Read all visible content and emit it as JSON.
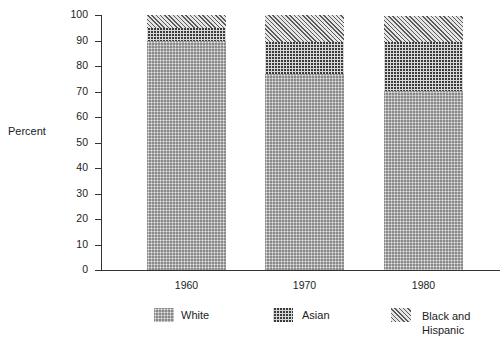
{
  "chart_data": {
    "type": "bar",
    "stacked": true,
    "title": "",
    "xlabel": "",
    "ylabel": "Percent",
    "ylim": [
      0,
      100
    ],
    "yticks": [
      "0",
      "10",
      "20",
      "30",
      "40",
      "50",
      "60",
      "70",
      "80",
      "90",
      "100"
    ],
    "categories": [
      "1960",
      "1970",
      "1980"
    ],
    "series": [
      {
        "name": "White",
        "pattern": "dotted",
        "values": [
          90,
          77,
          70
        ]
      },
      {
        "name": "Asian",
        "pattern": "crosshatch",
        "values": [
          5,
          12.5,
          19.5
        ]
      },
      {
        "name": "Black and Hispanic",
        "pattern": "diagonal",
        "values": [
          5,
          10.5,
          10
        ]
      }
    ],
    "grid": false,
    "legend_position": "bottom"
  },
  "legend": {
    "white": "White",
    "asian": "Asian",
    "bh_line1": "Black and",
    "bh_line2": "Hispanic"
  }
}
